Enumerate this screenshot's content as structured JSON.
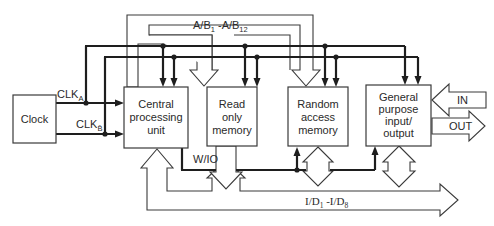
{
  "diagram": {
    "type": "microcomputer-block-diagram",
    "colors": {
      "line": "#1e1e1e",
      "outline": "#3a3a3a",
      "background": "#ffffff"
    },
    "blocks": {
      "clock": {
        "lines": [
          "Clock"
        ]
      },
      "cpu": {
        "lines": [
          "Central",
          "processing",
          "unit"
        ]
      },
      "rom": {
        "lines": [
          "Read",
          "only",
          "memory"
        ]
      },
      "ram": {
        "lines": [
          "Random",
          "access",
          "memory"
        ]
      },
      "gpio": {
        "lines": [
          "General",
          "purpose",
          "input/",
          "output"
        ]
      }
    },
    "signals": {
      "clk_a": {
        "base": "CLK",
        "sub": "A"
      },
      "clk_b": {
        "base": "CLK",
        "sub": "B̄"
      },
      "address_bus": {
        "p1": "A/B",
        "s1": "1",
        "p2": " -A/B",
        "s2": "12"
      },
      "data_bus": {
        "p1": "I/D",
        "s1": "1",
        "p2": " -I/D",
        "s2": "8"
      },
      "write_io": "W/IO",
      "in": "IN",
      "out": "OUT"
    }
  }
}
